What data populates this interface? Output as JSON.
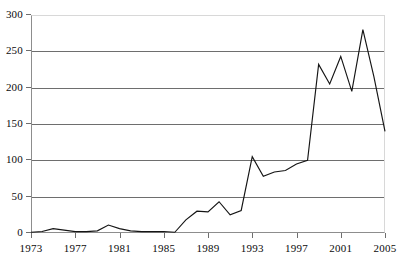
{
  "chart_data": {
    "type": "line",
    "title": "",
    "subtitle": "",
    "xlabel": "",
    "ylabel": "",
    "xlim": [
      1973,
      2005
    ],
    "ylim": [
      0,
      300
    ],
    "grid": true,
    "legend": false,
    "legend_position": "none",
    "y_ticks": [
      0,
      50,
      100,
      150,
      200,
      250,
      300
    ],
    "y_tick_labels": [
      "0",
      "50",
      "100",
      "150",
      "200",
      "250",
      "300"
    ],
    "x_ticks": [
      1973,
      1977,
      1981,
      1985,
      1989,
      1993,
      1997,
      2001,
      2005
    ],
    "x_tick_labels": [
      "1973",
      "1977",
      "1981",
      "1985",
      "1989",
      "1993",
      "1997",
      "2001",
      "2005"
    ],
    "x": [
      1973,
      1974,
      1975,
      1976,
      1977,
      1978,
      1979,
      1980,
      1981,
      1982,
      1983,
      1984,
      1985,
      1986,
      1987,
      1988,
      1989,
      1990,
      1991,
      1992,
      1993,
      1994,
      1995,
      1996,
      1997,
      1998,
      1999,
      2000,
      2001,
      2002,
      2003,
      2004,
      2005
    ],
    "values": [
      1,
      2,
      6,
      4,
      2,
      2,
      3,
      11,
      6,
      3,
      2,
      2,
      2,
      1,
      18,
      30,
      29,
      43,
      25,
      31,
      105,
      78,
      84,
      86,
      95,
      100,
      232,
      205,
      243,
      195,
      280,
      215,
      140
    ],
    "series": [
      {
        "name": "series-1",
        "color": "#151515",
        "values": [
          1,
          2,
          6,
          4,
          2,
          2,
          3,
          11,
          6,
          3,
          2,
          2,
          2,
          1,
          18,
          30,
          29,
          43,
          25,
          31,
          105,
          78,
          84,
          86,
          95,
          100,
          232,
          205,
          243,
          195,
          280,
          215,
          140
        ]
      }
    ],
    "annotations": []
  },
  "style": {
    "line_color": "#151515",
    "grid_color": "#6e6e6e",
    "axis_color": "#8d8d8d",
    "faint_color": "#d8d8d8",
    "background": "#ffffff",
    "text_color": "#0b0b0b"
  }
}
